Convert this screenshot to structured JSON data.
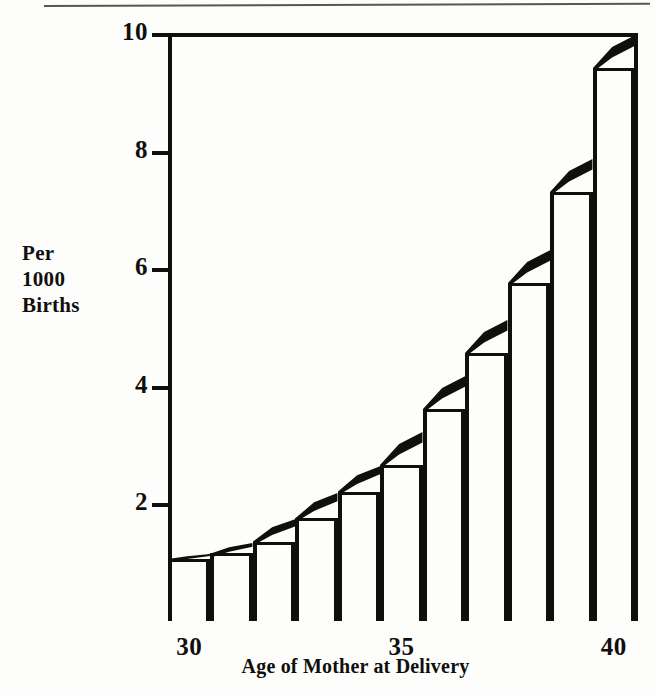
{
  "chart_data": {
    "type": "bar",
    "title": "",
    "xlabel": "Age of Mother at Delivery",
    "ylabel": "Per 1000 Births",
    "ylabel_lines": [
      "Per",
      "1000",
      "Births"
    ],
    "categories": [
      30,
      31,
      32,
      33,
      34,
      35,
      36,
      37,
      38,
      39,
      40
    ],
    "values": [
      1.05,
      1.15,
      1.35,
      1.75,
      2.2,
      2.65,
      3.6,
      4.55,
      5.75,
      7.3,
      9.4
    ],
    "x_tick_labels": [
      "30",
      "35",
      "40"
    ],
    "x_tick_values": [
      30,
      35,
      40
    ],
    "y_tick_labels": [
      "10",
      "8",
      "6",
      "4",
      "2"
    ],
    "y_tick_values": [
      10,
      8,
      6,
      4,
      2
    ],
    "ylim": [
      0,
      10
    ],
    "xlim": [
      29.5,
      40.5
    ],
    "grid": false,
    "legend": "none",
    "bar_fill": "#fdfdfc",
    "bar_outline": "#100f0d",
    "accent": "#100f0d",
    "style_note": "bars capped with solid black wedge rising toward next bar"
  },
  "figure": {
    "background": "#fdfdfc",
    "frame_color": "#100f0d"
  }
}
